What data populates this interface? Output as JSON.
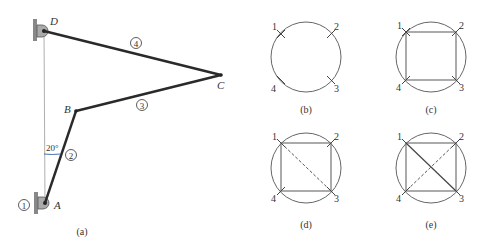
{
  "figure_a": {
    "caption": "(a)",
    "points": {
      "A": "A",
      "B": "B",
      "C": "C",
      "D": "D"
    },
    "links": {
      "ground": "1",
      "crank": "2",
      "coupler": "3",
      "rocker": "4"
    },
    "angle_label": "20°"
  },
  "figure_b": {
    "caption": "(b)",
    "nodes": [
      "1",
      "2",
      "3",
      "4"
    ]
  },
  "figure_c": {
    "caption": "(c)",
    "nodes": [
      "1",
      "2",
      "3",
      "4"
    ]
  },
  "figure_d": {
    "caption": "(d)",
    "nodes": [
      "1",
      "2",
      "3",
      "4"
    ]
  },
  "figure_e": {
    "caption": "(e)",
    "nodes": [
      "1",
      "2",
      "3",
      "4"
    ]
  },
  "colors": {
    "link": "#2a2a2a",
    "circle": "#666666",
    "angle_arc": "#3a5fa8",
    "ground": "#888888"
  }
}
